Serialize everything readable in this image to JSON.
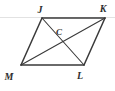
{
  "figure": {
    "kind": "geometry-diagram",
    "shape_name": "parallelogram",
    "background_color": "#ffffff",
    "stroke_color": "#3a3a3a",
    "label_color": "#2e2e2e",
    "artifact_line_color": "#e2e2e2",
    "vertices": [
      {
        "id": "J",
        "label": "J",
        "x": 42,
        "y": 18,
        "label_x": 40,
        "label_y": 13
      },
      {
        "id": "K",
        "label": "K",
        "x": 105,
        "y": 18,
        "label_x": 103,
        "label_y": 12
      },
      {
        "id": "L",
        "label": "L",
        "x": 84,
        "y": 65,
        "label_x": 80,
        "label_y": 79
      },
      {
        "id": "M",
        "label": "M",
        "x": 21,
        "y": 65,
        "label_x": 9,
        "label_y": 80
      }
    ],
    "interior_points": [
      {
        "id": "C",
        "label": "C",
        "x": 63,
        "y": 41.5,
        "label_x": 59,
        "label_y": 35
      }
    ],
    "sides": [
      {
        "id": "JK",
        "from": "J",
        "to": "K"
      },
      {
        "id": "KL",
        "from": "K",
        "to": "L"
      },
      {
        "id": "LM",
        "from": "L",
        "to": "M"
      },
      {
        "id": "MJ",
        "from": "M",
        "to": "J"
      }
    ],
    "diagonals": [
      {
        "id": "JL",
        "from": "J",
        "to": "L"
      },
      {
        "id": "MK",
        "from": "M",
        "to": "K"
      }
    ]
  }
}
